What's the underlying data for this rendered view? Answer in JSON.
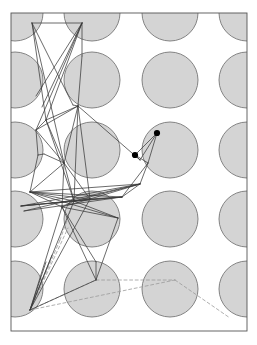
{
  "figure": {
    "caption": "",
    "width": 257,
    "height": 345,
    "background_color": "#ffffff"
  },
  "chart_data": {
    "type": "scatter",
    "title": "",
    "xlabel": "",
    "ylabel": "",
    "xlim": [
      11,
      247
    ],
    "ylim": [
      13,
      331
    ],
    "grid": false,
    "legend": null,
    "frame": {
      "x": 11,
      "y": 13,
      "width": 236,
      "height": 318,
      "stroke": "#555555",
      "stroke_width": 0.9,
      "fill": "#ffffff"
    },
    "disks": {
      "radius": 28,
      "fill": "#d4d4d4",
      "stroke": "#777777",
      "stroke_width": 0.9,
      "lattice_dx": 77.5,
      "lattice_dy": 69.5,
      "centers": [
        [
          15,
          13
        ],
        [
          92,
          13
        ],
        [
          170,
          13
        ],
        [
          247,
          13
        ],
        [
          15,
          80
        ],
        [
          92,
          80
        ],
        [
          170,
          80
        ],
        [
          247,
          80
        ],
        [
          15,
          150
        ],
        [
          92,
          150
        ],
        [
          170,
          150
        ],
        [
          247,
          150
        ],
        [
          15,
          219
        ],
        [
          92,
          219
        ],
        [
          170,
          219
        ],
        [
          247,
          219
        ],
        [
          15,
          289
        ],
        [
          92,
          289
        ],
        [
          170,
          289
        ],
        [
          247,
          289
        ]
      ]
    },
    "solid_edges": {
      "stroke": "#3a3a3a",
      "stroke_width": 0.75,
      "segments": [
        [
          32,
          23,
          46,
          120
        ],
        [
          32,
          23,
          73,
          105
        ],
        [
          32,
          23,
          82,
          23
        ],
        [
          32,
          23,
          64,
          163
        ],
        [
          82,
          23,
          42,
          107
        ],
        [
          82,
          23,
          36,
          130
        ],
        [
          82,
          23,
          82,
          56
        ],
        [
          82,
          23,
          36,
          96
        ],
        [
          82,
          23,
          46,
          120
        ],
        [
          82,
          56,
          78,
          106
        ],
        [
          78,
          106,
          46,
          120
        ],
        [
          78,
          106,
          36,
          130
        ],
        [
          78,
          106,
          73,
          105
        ],
        [
          78,
          106,
          140,
          160
        ],
        [
          78,
          106,
          64,
          163
        ],
        [
          78,
          106,
          90,
          199
        ],
        [
          78,
          106,
          74,
          201
        ],
        [
          46,
          120,
          36,
          130
        ],
        [
          46,
          120,
          64,
          163
        ],
        [
          46,
          120,
          74,
          201
        ],
        [
          36,
          130,
          38,
          155
        ],
        [
          36,
          130,
          64,
          163
        ],
        [
          38,
          155,
          44,
          154
        ],
        [
          38,
          155,
          30,
          192
        ],
        [
          44,
          154,
          64,
          163
        ],
        [
          64,
          163,
          74,
          201
        ],
        [
          64,
          163,
          90,
          199
        ],
        [
          64,
          163,
          30,
          192
        ],
        [
          64,
          163,
          62,
          207
        ],
        [
          30,
          192,
          74,
          201
        ],
        [
          30,
          192,
          90,
          199
        ],
        [
          30,
          192,
          140,
          184
        ],
        [
          30,
          192,
          122,
          197
        ],
        [
          30,
          192,
          62,
          207
        ],
        [
          30,
          192,
          118,
          218
        ],
        [
          21,
          206,
          74,
          201
        ],
        [
          21,
          206,
          90,
          199
        ],
        [
          21,
          206,
          140,
          184
        ],
        [
          21,
          206,
          122,
          197
        ],
        [
          24,
          211,
          140,
          184
        ],
        [
          24,
          211,
          122,
          197
        ],
        [
          74,
          201,
          90,
          199
        ],
        [
          74,
          201,
          140,
          184
        ],
        [
          74,
          201,
          122,
          197
        ],
        [
          74,
          201,
          118,
          218
        ],
        [
          74,
          201,
          62,
          207
        ],
        [
          74,
          201,
          30,
          310
        ],
        [
          90,
          199,
          140,
          184
        ],
        [
          90,
          199,
          122,
          197
        ],
        [
          90,
          199,
          62,
          207
        ],
        [
          90,
          199,
          30,
          310
        ],
        [
          62,
          207,
          118,
          218
        ],
        [
          62,
          207,
          30,
          310
        ],
        [
          62,
          207,
          96,
          280
        ],
        [
          118,
          218,
          96,
          280
        ],
        [
          140,
          184,
          122,
          197
        ],
        [
          140,
          160,
          157,
          133
        ],
        [
          140,
          160,
          135,
          155
        ],
        [
          135,
          155,
          157,
          133
        ],
        [
          135,
          155,
          148,
          163
        ],
        [
          148,
          163,
          157,
          133
        ],
        [
          148,
          163,
          122,
          197
        ],
        [
          148,
          163,
          140,
          184
        ],
        [
          96,
          280,
          30,
          310
        ],
        [
          96,
          280,
          96,
          262
        ],
        [
          96,
          262,
          62,
          207
        ],
        [
          30,
          310,
          46,
          262
        ],
        [
          30,
          310,
          52,
          255
        ]
      ]
    },
    "dashed_edges": {
      "stroke": "#9a9a9a",
      "stroke_width": 0.8,
      "dash_pattern": "3,2.6",
      "segments": [
        [
          30,
          310,
          175,
          280
        ],
        [
          175,
          280,
          230,
          318
        ],
        [
          30,
          310,
          96,
          280
        ],
        [
          96,
          280,
          175,
          280
        ],
        [
          30,
          310,
          60,
          240
        ],
        [
          60,
          240,
          74,
          201
        ],
        [
          30,
          310,
          68,
          228
        ]
      ]
    },
    "marked_points": {
      "fill": "#000000",
      "radius": 3.1,
      "points": [
        [
          157,
          133
        ],
        [
          135,
          155
        ]
      ]
    }
  }
}
